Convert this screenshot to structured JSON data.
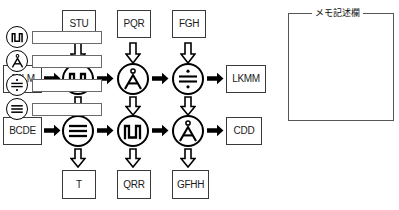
{
  "diagram": {
    "title_hidden": "",
    "input_boxes": [
      {
        "id": "in-top",
        "label": "JKLM"
      },
      {
        "id": "in-bottom",
        "label": "BCDE"
      }
    ],
    "top_boxes": [
      {
        "id": "top-1",
        "label": "STU"
      },
      {
        "id": "top-2",
        "label": "PQR"
      },
      {
        "id": "top-3",
        "label": "FGH"
      }
    ],
    "bottom_boxes": [
      {
        "id": "bot-1",
        "label": "T"
      },
      {
        "id": "bot-2",
        "label": "QRR"
      },
      {
        "id": "bot-3",
        "label": "GFHH"
      }
    ],
    "output_boxes": [
      {
        "id": "out-top",
        "label": "LKMM"
      },
      {
        "id": "out-bottom",
        "label": "CDD"
      }
    ],
    "operators_row_top": [
      {
        "id": "op-r1-c1",
        "symbol": "pulse-wave",
        "glyph": "Л"
      },
      {
        "id": "op-r1-c2",
        "symbol": "a-ring",
        "glyph": "Å"
      },
      {
        "id": "op-r1-c3",
        "symbol": "divide",
        "glyph": "÷"
      }
    ],
    "operators_row_bottom": [
      {
        "id": "op-r2-c1",
        "symbol": "triple-bar",
        "glyph": "≡"
      },
      {
        "id": "op-r2-c2",
        "symbol": "pulse-wave",
        "glyph": "Л"
      },
      {
        "id": "op-r2-c3",
        "symbol": "a-ring",
        "glyph": "Å"
      }
    ],
    "arrow_right_icon": "arrow-right-solid",
    "arrow_down_icon": "arrow-down-hollow",
    "colors": {
      "stroke": "#000000",
      "box_border": "#3a3a3a",
      "panel_border": "#555555",
      "field_border": "#6a6a6a",
      "background": "#ffffff"
    }
  },
  "memo": {
    "title": "メモ記述欄",
    "rows": [
      {
        "icon": "pulse-wave-icon",
        "glyph": "Л",
        "value": "",
        "placeholder": ""
      },
      {
        "icon": "a-ring-icon",
        "glyph": "Å",
        "value": "",
        "placeholder": ""
      },
      {
        "icon": "divide-icon",
        "glyph": "÷",
        "value": "",
        "placeholder": ""
      },
      {
        "icon": "triple-bar-icon",
        "glyph": "≡",
        "value": "",
        "placeholder": ""
      }
    ]
  }
}
